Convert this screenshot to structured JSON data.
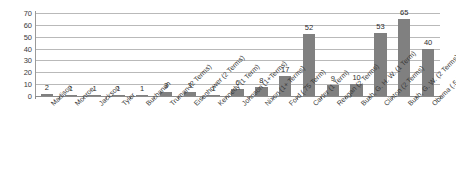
{
  "chart_data": {
    "type": "bar",
    "title": "",
    "subtitle": "",
    "xlabel": "",
    "ylabel": "",
    "ylim": [
      0,
      70
    ],
    "ytick_step": 10,
    "yticks": [
      0,
      10,
      20,
      30,
      40,
      50,
      60,
      70
    ],
    "grid": true,
    "legend": false,
    "legend_position": "none",
    "bar_color": "#808080",
    "gridline_color": "#b9b9b9",
    "axis_color": "#8c8c8c",
    "label_color": "#2e2e2e",
    "categories": [
      "Madison",
      "Monroe",
      "Jackson",
      "Tyler",
      "Buchanan",
      "Truman (2 Terms)",
      "Eisenhower (2 Terms)",
      "Kennedy (1 Term)",
      "Johnson (1+Terms)",
      "Nixon (1+ Terms)",
      "Ford (.75 Term)",
      "Carter (1 Term)",
      "Reagan (2 Terms)",
      "Bush, G. H. W. (1 Term)",
      "Clinton (2 Terms)",
      "Bush, G. W. (2 Terms)",
      "Obama (.5 Term)"
    ],
    "values": [
      2,
      1,
      1,
      1,
      1,
      3,
      3,
      1,
      6,
      8,
      17,
      52,
      9,
      10,
      53,
      65,
      40
    ],
    "data_labels": [
      "2",
      "1",
      "1",
      "1",
      "1",
      "3",
      "3",
      "1",
      "6",
      "8",
      "17",
      "52",
      "9",
      "10",
      "53",
      "65",
      "40"
    ]
  }
}
